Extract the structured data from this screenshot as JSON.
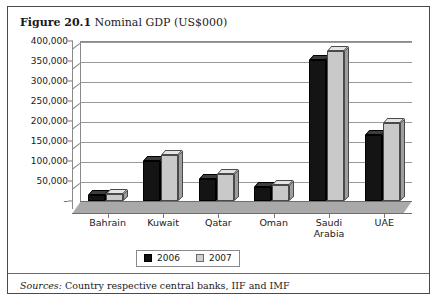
{
  "figure": {
    "number": "Figure 20.1",
    "caption": "Nominal GDP (US$000)",
    "sources_label": "Sources:",
    "sources_text": "Country respective central banks, IIF and IMF"
  },
  "chart_data": {
    "type": "bar",
    "title": "Nominal GDP (US$000)",
    "xlabel": "",
    "ylabel": "",
    "categories": [
      "Bahrain",
      "Kuwait",
      "Qatar",
      "Oman",
      "Saudi Arabia",
      "UAE"
    ],
    "series": [
      {
        "name": "2006",
        "color": "#141414",
        "values": [
          15000,
          100000,
          55000,
          35000,
          352000,
          165000
        ]
      },
      {
        "name": "2007",
        "color": "#c9c9c9",
        "values": [
          18000,
          115000,
          68000,
          40000,
          375000,
          195000
        ]
      }
    ],
    "ylim": [
      0,
      400000
    ],
    "ytick_values": [
      0,
      50000,
      100000,
      150000,
      200000,
      250000,
      300000,
      350000,
      400000
    ],
    "ytick_labels": [
      "–",
      "50,000",
      "100,000",
      "150,000",
      "200,000",
      "250,000",
      "300,000",
      "350,000",
      "400,000"
    ],
    "grid": true,
    "legend_position": "bottom",
    "style": "3d-column"
  }
}
